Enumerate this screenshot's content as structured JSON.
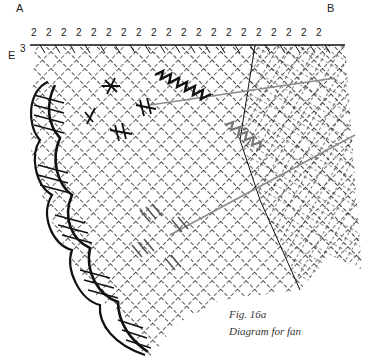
{
  "labels": {
    "a": "A",
    "b": "B",
    "e": "E",
    "e_sup": "3"
  },
  "pair_counts": [
    "2",
    "2",
    "2",
    "2",
    "2",
    "2",
    "2",
    "2",
    "2",
    "2",
    "2",
    "2",
    "2",
    "2",
    "2",
    "2",
    "2",
    "2",
    "2",
    "2"
  ],
  "caption": {
    "fig": "Fig. 16a",
    "title": "Diagram for fan"
  },
  "colors": {
    "ink": "#111111",
    "grey_line": "#8a8a8a",
    "background": "#ffffff"
  }
}
